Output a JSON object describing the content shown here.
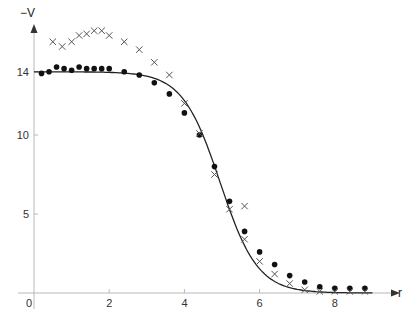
{
  "chart_data": {
    "type": "scatter",
    "title": "",
    "xlabel": "r",
    "ylabel": "−V",
    "xlim": [
      0,
      9.8
    ],
    "ylim": [
      0,
      17
    ],
    "grid": false,
    "legend": null,
    "x_ticks": [
      0,
      2,
      4,
      6,
      8
    ],
    "y_ticks": [
      0,
      5,
      10,
      14
    ],
    "series": [
      {
        "name": "dots",
        "marker": "filled-circle",
        "points": [
          [
            0.2,
            13.9
          ],
          [
            0.4,
            14.0
          ],
          [
            0.6,
            14.3
          ],
          [
            0.8,
            14.2
          ],
          [
            1.0,
            14.1
          ],
          [
            1.2,
            14.3
          ],
          [
            1.4,
            14.2
          ],
          [
            1.6,
            14.2
          ],
          [
            1.8,
            14.2
          ],
          [
            2.0,
            14.2
          ],
          [
            2.4,
            14.0
          ],
          [
            2.8,
            13.8
          ],
          [
            3.2,
            13.3
          ],
          [
            3.6,
            12.6
          ],
          [
            4.0,
            11.4
          ],
          [
            4.4,
            10.0
          ],
          [
            4.8,
            8.0
          ],
          [
            5.2,
            5.8
          ],
          [
            5.6,
            3.9
          ],
          [
            6.0,
            2.6
          ],
          [
            6.4,
            1.8
          ],
          [
            6.8,
            1.1
          ],
          [
            7.2,
            0.7
          ],
          [
            7.6,
            0.4
          ],
          [
            8.0,
            0.3
          ],
          [
            8.4,
            0.3
          ],
          [
            8.8,
            0.3
          ]
        ]
      },
      {
        "name": "crosses",
        "marker": "x",
        "points": [
          [
            0.5,
            15.9
          ],
          [
            0.75,
            15.6
          ],
          [
            1.0,
            15.9
          ],
          [
            1.2,
            16.3
          ],
          [
            1.4,
            16.4
          ],
          [
            1.6,
            16.6
          ],
          [
            1.8,
            16.6
          ],
          [
            2.0,
            16.3
          ],
          [
            2.4,
            15.9
          ],
          [
            2.8,
            15.4
          ],
          [
            3.2,
            14.6
          ],
          [
            3.6,
            13.8
          ],
          [
            4.0,
            12.0
          ],
          [
            4.4,
            10.1
          ],
          [
            4.8,
            7.5
          ],
          [
            5.2,
            5.3
          ],
          [
            5.6,
            5.5
          ],
          [
            5.6,
            3.4
          ],
          [
            6.0,
            2.0
          ],
          [
            6.4,
            1.2
          ],
          [
            6.8,
            0.6
          ],
          [
            7.2,
            0.2
          ],
          [
            7.6,
            0.1
          ],
          [
            8.0,
            0.1
          ],
          [
            8.4,
            0.1
          ],
          [
            8.8,
            0.1
          ]
        ]
      },
      {
        "name": "fit-curve",
        "marker": "line",
        "function": "Woods-Saxon: V0/(1+exp((r-R)/a))",
        "params": {
          "V0": 14.0,
          "R": 4.95,
          "a": 0.5
        },
        "points": [
          [
            0.0,
            14.0
          ],
          [
            1.0,
            14.0
          ],
          [
            2.0,
            13.96
          ],
          [
            2.5,
            13.89
          ],
          [
            3.0,
            13.72
          ],
          [
            3.5,
            13.22
          ],
          [
            4.0,
            12.0
          ],
          [
            4.5,
            9.69
          ],
          [
            5.0,
            6.86
          ],
          [
            5.5,
            4.08
          ],
          [
            6.0,
            1.82
          ],
          [
            6.5,
            0.61
          ],
          [
            7.0,
            0.23
          ],
          [
            7.5,
            0.08
          ],
          [
            8.0,
            0.03
          ],
          [
            9.0,
            0.0
          ]
        ]
      }
    ]
  },
  "axes": {
    "x_label": "r",
    "y_label": "−V",
    "x_tick_labels": [
      "0",
      "2",
      "4",
      "6",
      "8"
    ],
    "y_tick_labels": [
      "5",
      "10",
      "14"
    ]
  },
  "colors": {
    "axis": "#b8b8b8",
    "marker_dot": "#111111",
    "marker_cross": "#555555",
    "curve": "#222222"
  }
}
